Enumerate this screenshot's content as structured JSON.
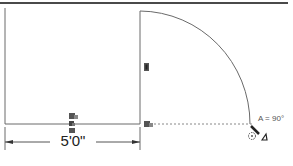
{
  "drawing": {
    "dimension_label": "5'0\"",
    "angle_label": "A = 90°",
    "colors": {
      "line": "#6a6a6a",
      "top_bar": "#4a4a4a",
      "grip": "#555555",
      "background": "#ffffff"
    }
  },
  "icons": {
    "grip_marker": "grip-square-icon",
    "rotation_cursor": "rotate-cursor-icon",
    "angle_indicator": "angle-triangle-icon"
  }
}
